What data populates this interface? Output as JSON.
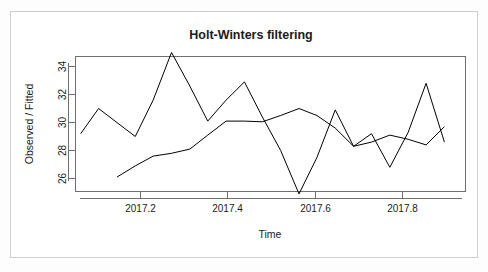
{
  "chart_data": {
    "type": "line",
    "title": "Holt-Winters filtering",
    "xlabel": "Time",
    "ylabel": "Observed / Fitted",
    "xlim": [
      2017.06,
      2017.93
    ],
    "ylim": [
      24.6,
      35.2
    ],
    "xticks": [
      "2017.2",
      "2017.4",
      "2017.6",
      "2017.8"
    ],
    "xtick_values": [
      2017.2,
      2017.4,
      2017.6,
      2017.8
    ],
    "yticks": [
      "26",
      "28",
      "30",
      "32",
      "34"
    ],
    "ytick_values": [
      26,
      28,
      30,
      32,
      34
    ],
    "grid": false,
    "legend": "none",
    "series": [
      {
        "name": "Observed",
        "color": "#000000",
        "x": [
          2017.063,
          2017.104,
          2017.146,
          2017.188,
          2017.229,
          2017.271,
          2017.313,
          2017.354,
          2017.396,
          2017.438,
          2017.479,
          2017.521,
          2017.563,
          2017.604,
          2017.646,
          2017.688,
          2017.729,
          2017.771,
          2017.813,
          2017.854,
          2017.896
        ],
        "y": [
          29.2,
          31.0,
          30.0,
          29.0,
          31.6,
          35.0,
          32.6,
          30.1,
          31.6,
          32.9,
          30.4,
          28.0,
          24.9,
          27.5,
          30.9,
          28.3,
          29.2,
          26.8,
          29.3,
          32.8,
          28.6
        ]
      },
      {
        "name": "Fitted",
        "color": "#000000",
        "x": [
          2017.146,
          2017.188,
          2017.229,
          2017.271,
          2017.313,
          2017.354,
          2017.396,
          2017.438,
          2017.479,
          2017.521,
          2017.563,
          2017.604,
          2017.646,
          2017.688,
          2017.729,
          2017.771,
          2017.813,
          2017.854,
          2017.896
        ],
        "y": [
          26.1,
          26.9,
          27.6,
          27.8,
          28.1,
          29.1,
          30.1,
          30.1,
          30.05,
          30.5,
          31.0,
          30.5,
          29.6,
          28.3,
          28.6,
          29.1,
          28.8,
          28.4,
          29.7
        ]
      }
    ]
  }
}
